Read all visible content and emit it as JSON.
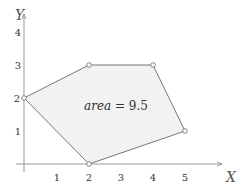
{
  "axes": {
    "x_label": "X",
    "y_label": "Y",
    "x_ticks": [
      "1",
      "2",
      "3",
      "4",
      "5"
    ],
    "y_ticks": [
      "1",
      "2",
      "3",
      "4"
    ]
  },
  "polygon": {
    "vertices": [
      [
        0,
        2
      ],
      [
        2,
        3
      ],
      [
        4,
        3
      ],
      [
        5,
        1
      ],
      [
        2,
        0
      ]
    ],
    "fill": "#f2f2f2",
    "stroke": "#777777"
  },
  "annotation": {
    "text_var": "area",
    "text_eq": " = 9.5"
  }
}
